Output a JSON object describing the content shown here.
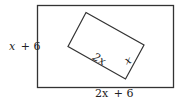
{
  "diagram": {
    "outer_rect": {
      "height_label": "x + 6",
      "width_label": "2x + 6",
      "height_var": "x",
      "height_op": "+ 6",
      "width_var": "2x",
      "width_op": "+ 6"
    },
    "inner_rect": {
      "long_side_label": "2x",
      "short_side_label": "x"
    },
    "colors": {
      "stroke": "#333333",
      "background": "#ffffff"
    }
  }
}
